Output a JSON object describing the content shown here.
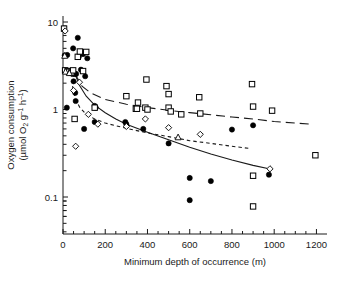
{
  "chart_data": {
    "type": "scatter",
    "title": "",
    "xlabel": "Minimum depth of occurrence (m)",
    "ylabel_line1": "Oxygen consumption",
    "ylabel_line2_prefix": "(µmol O",
    "ylabel_line2_sub": "2",
    "ylabel_line2_mid": " g",
    "ylabel_line2_sup1": "–1",
    "ylabel_line2_mid2": " h",
    "ylabel_line2_sup2": "–1",
    "ylabel_line2_suffix": ")",
    "ylabel_full": "Oxygen consumption (µmol O2 g-1 h-1)",
    "xlim": [
      0,
      1250
    ],
    "ylim": [
      0.05,
      11
    ],
    "yscale": "log",
    "xscale": "linear",
    "grid": false,
    "legend_position": "none",
    "xticks": [
      0,
      200,
      400,
      600,
      800,
      1000,
      1200
    ],
    "xticklabels": [
      "0",
      "200",
      "400",
      "600",
      "800",
      "1000",
      "1200"
    ],
    "yticks": [
      10,
      1,
      0.1
    ],
    "yticklabels": [
      "10",
      "1",
      "0.1"
    ],
    "yminorticks": [
      9,
      8,
      7,
      6,
      5,
      4,
      3,
      2,
      0.9,
      0.8,
      0.7,
      0.6,
      0.5,
      0.4,
      0.3,
      0.2,
      0.09,
      0.08,
      0.07,
      0.06
    ],
    "series": [
      {
        "name": "filled-circles",
        "marker": "filled-circle",
        "color": "#000000",
        "points": [
          [
            8,
            4.15
          ],
          [
            20,
            4.2
          ],
          [
            18,
            1.05
          ],
          [
            30,
            2.75
          ],
          [
            35,
            2.7
          ],
          [
            40,
            2.6
          ],
          [
            45,
            2.55
          ],
          [
            48,
            5.0
          ],
          [
            50,
            2.1
          ],
          [
            52,
            2.6
          ],
          [
            55,
            2.55
          ],
          [
            58,
            1.55
          ],
          [
            60,
            1.25
          ],
          [
            62,
            2.55
          ],
          [
            70,
            6.6
          ],
          [
            75,
            4.0
          ],
          [
            85,
            2.85
          ],
          [
            95,
            4.3
          ],
          [
            100,
            0.6
          ],
          [
            105,
            2.4
          ],
          [
            115,
            3.85
          ],
          [
            150,
            1.1
          ],
          [
            155,
            1.05
          ],
          [
            150,
            0.72
          ],
          [
            295,
            0.72
          ],
          [
            300,
            0.68
          ],
          [
            380,
            0.6
          ],
          [
            500,
            0.41
          ],
          [
            600,
            0.165
          ],
          [
            600,
            0.092
          ],
          [
            700,
            0.152
          ],
          [
            800,
            0.59
          ],
          [
            900,
            0.66
          ],
          [
            975,
            0.18
          ]
        ]
      },
      {
        "name": "open-squares",
        "marker": "open-square",
        "color": "#000000",
        "points": [
          [
            5,
            8.4
          ],
          [
            10,
            2.8
          ],
          [
            22,
            2.75
          ],
          [
            30,
            2.7
          ],
          [
            40,
            2.65
          ],
          [
            48,
            2.8
          ],
          [
            55,
            0.78
          ],
          [
            70,
            4.0
          ],
          [
            80,
            4.6
          ],
          [
            95,
            2.75
          ],
          [
            110,
            4.55
          ],
          [
            150,
            1.05
          ],
          [
            300,
            1.42
          ],
          [
            345,
            1.02
          ],
          [
            350,
            1.02
          ],
          [
            355,
            1.2
          ],
          [
            390,
            1.05
          ],
          [
            395,
            2.2
          ],
          [
            400,
            1.0
          ],
          [
            490,
            1.85
          ],
          [
            500,
            1.5
          ],
          [
            500,
            1.05
          ],
          [
            510,
            0.95
          ],
          [
            560,
            0.88
          ],
          [
            645,
            1.38
          ],
          [
            650,
            0.9
          ],
          [
            895,
            1.95
          ],
          [
            900,
            1.08
          ],
          [
            900,
            0.175
          ],
          [
            900,
            0.078
          ],
          [
            990,
            0.97
          ],
          [
            1195,
            0.3
          ]
        ]
      },
      {
        "name": "open-diamonds",
        "marker": "open-diamond",
        "color": "#000000",
        "points": [
          [
            10,
            7.9
          ],
          [
            50,
            1.65
          ],
          [
            60,
            0.38
          ],
          [
            78,
            2.05
          ],
          [
            120,
            0.88
          ],
          [
            165,
            0.68
          ],
          [
            300,
            0.64
          ],
          [
            390,
            0.78
          ],
          [
            500,
            0.62
          ],
          [
            650,
            0.52
          ],
          [
            980,
            0.21
          ]
        ]
      },
      {
        "name": "open-triangles",
        "marker": "open-triangle",
        "color": "#000000",
        "points": [
          [
            8,
            4.1
          ],
          [
            12,
            2.7
          ],
          [
            30,
            2.6
          ],
          [
            545,
            0.48
          ]
        ]
      }
    ],
    "fitted_curves": [
      {
        "name": "solid-curve",
        "style": "solid",
        "description": "Steeply declining power-law fit through filled circles",
        "points": [
          [
            55,
            2.6
          ],
          [
            80,
            1.85
          ],
          [
            110,
            1.42
          ],
          [
            150,
            1.12
          ],
          [
            200,
            0.92
          ],
          [
            250,
            0.78
          ],
          [
            300,
            0.68
          ],
          [
            400,
            0.55
          ],
          [
            500,
            0.45
          ],
          [
            600,
            0.37
          ],
          [
            700,
            0.31
          ],
          [
            800,
            0.265
          ],
          [
            900,
            0.23
          ],
          [
            975,
            0.21
          ]
        ]
      },
      {
        "name": "long-dash-curve",
        "style": "long-dash",
        "description": "Shallow declining fit through open squares",
        "points": [
          [
            55,
            2.6
          ],
          [
            90,
            1.85
          ],
          [
            130,
            1.55
          ],
          [
            200,
            1.3
          ],
          [
            300,
            1.15
          ],
          [
            400,
            1.05
          ],
          [
            500,
            0.98
          ],
          [
            600,
            0.92
          ],
          [
            700,
            0.87
          ],
          [
            800,
            0.82
          ],
          [
            900,
            0.78
          ],
          [
            1000,
            0.73
          ],
          [
            1100,
            0.7
          ],
          [
            1180,
            0.68
          ]
        ]
      },
      {
        "name": "short-dash-curve",
        "style": "short-dash",
        "description": "Intermediate declining fit through diamonds/triangles",
        "points": [
          [
            45,
            1.85
          ],
          [
            60,
            1.3
          ],
          [
            80,
            1.05
          ],
          [
            110,
            0.88
          ],
          [
            150,
            0.78
          ],
          [
            200,
            0.7
          ],
          [
            300,
            0.61
          ],
          [
            400,
            0.54
          ],
          [
            500,
            0.49
          ],
          [
            600,
            0.44
          ],
          [
            700,
            0.41
          ],
          [
            800,
            0.38
          ],
          [
            880,
            0.36
          ]
        ]
      }
    ]
  }
}
